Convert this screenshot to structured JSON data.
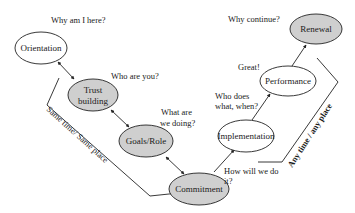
{
  "colors": {
    "shaded_fill": "#cfcfcf",
    "plain_fill": "#ffffff",
    "stroke": "#222222"
  },
  "nodes": {
    "orientation": {
      "label": "Orientation",
      "shaded": false
    },
    "trust": {
      "label_line1": "Trust",
      "label_line2": "building",
      "shaded": true
    },
    "goals": {
      "label": "Goals/Role",
      "shaded": true
    },
    "commitment": {
      "label": "Commitment",
      "shaded": true
    },
    "implementation": {
      "label": "Implementation",
      "shaded": false
    },
    "performance": {
      "label": "Performance",
      "shaded": false
    },
    "renewal": {
      "label": "Renewal",
      "shaded": true
    }
  },
  "questions": {
    "orientation": "Why am I here?",
    "trust": "Who are you?",
    "goals_line1": "What are",
    "goals_line2": "we doing?",
    "commitment_line1": "How will we do",
    "commitment_line2": "it?",
    "implementation_line1": "Who does",
    "implementation_line2": "what, when?",
    "performance": "Great!",
    "renewal": "Why continue?"
  },
  "side_labels": {
    "left": "Same time/ Same place",
    "right": "Any time / any place"
  }
}
